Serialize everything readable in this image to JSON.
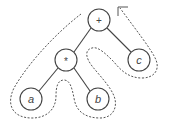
{
  "diagram": {
    "type": "expression-tree",
    "traversal": "dashed path around tree with arrowhead at root (Euler tour)",
    "nodes": [
      {
        "id": "plus",
        "label": "+",
        "x": 99,
        "y": 20
      },
      {
        "id": "times",
        "label": "*",
        "x": 66,
        "y": 60
      },
      {
        "id": "c",
        "label": "c",
        "x": 139,
        "y": 60
      },
      {
        "id": "a",
        "label": "a",
        "x": 31,
        "y": 99
      },
      {
        "id": "b",
        "label": "b",
        "x": 98,
        "y": 99
      }
    ],
    "edges": [
      [
        "plus",
        "times"
      ],
      [
        "plus",
        "c"
      ],
      [
        "times",
        "a"
      ],
      [
        "times",
        "b"
      ]
    ],
    "colors": {
      "stroke": "#444444",
      "background": "#ffffff"
    }
  }
}
